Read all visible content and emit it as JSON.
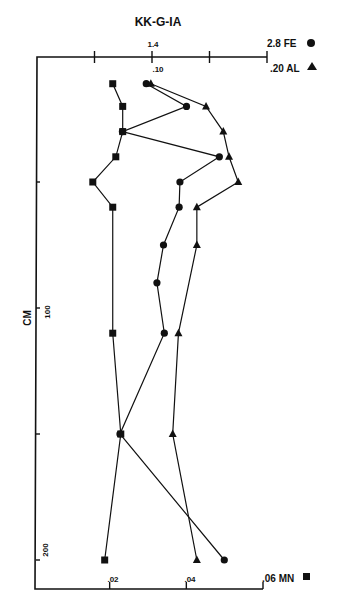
{
  "chart_data": {
    "type": "line",
    "title": "KK-G-IA",
    "orientation": "depth-profile (depth on vertical axis, increasing downward)",
    "ylabel": "CM",
    "ylim": [
      0,
      210
    ],
    "y_ticks": [
      50,
      100,
      150,
      200
    ],
    "y_tick_labels": [
      {
        "value": 100,
        "label": "100"
      },
      {
        "value": 200,
        "label": "200"
      }
    ],
    "top_axis": {
      "scales": [
        {
          "series": "FE",
          "label": "2.8 FE",
          "range": [
            0,
            2.8
          ],
          "labeled_ticks": [
            {
              "value": 1.4,
              "label": "1.4"
            },
            {
              "value": 2.8,
              "label": "2.8"
            }
          ]
        },
        {
          "series": "AL",
          "label": ".20 AL",
          "range": [
            0,
            0.2
          ],
          "labeled_ticks": [
            {
              "value": 0.1,
              "label": ".10"
            },
            {
              "value": 0.2,
              "label": ".20"
            }
          ]
        }
      ],
      "tick_fractions": [
        0.25,
        0.5,
        0.75,
        1.0
      ]
    },
    "bottom_axis": {
      "series": "MN",
      "label": ".06 MN",
      "range": [
        0,
        0.06
      ],
      "labeled_ticks": [
        {
          "value": 0.02,
          "label": ".02"
        },
        {
          "value": 0.04,
          "label": ".04"
        },
        {
          "value": 0.06,
          "label": ".06"
        }
      ]
    },
    "grid": false,
    "legend": [
      {
        "name": "FE",
        "marker": "circle",
        "position": "top-right"
      },
      {
        "name": "AL",
        "marker": "triangle",
        "position": "top-right"
      },
      {
        "name": "MN",
        "marker": "square",
        "position": "bottom-right"
      }
    ],
    "series": [
      {
        "name": "FE",
        "marker": "circle",
        "axis": "top",
        "depth_cm": [
          11,
          20,
          30,
          40,
          50,
          60,
          75,
          90,
          110,
          150,
          200
        ],
        "values": [
          1.33,
          1.82,
          1.04,
          2.22,
          1.74,
          1.73,
          1.54,
          1.46,
          1.55,
          1.01,
          2.28
        ]
      },
      {
        "name": "AL",
        "marker": "triangle",
        "axis": "top",
        "depth_cm": [
          11,
          20,
          30,
          40,
          50,
          60,
          75,
          110,
          150,
          200
        ],
        "values": [
          0.099,
          0.147,
          0.162,
          0.167,
          0.175,
          0.139,
          0.139,
          0.123,
          0.118,
          0.139
        ]
      },
      {
        "name": "MN",
        "marker": "square",
        "axis": "bottom",
        "depth_cm": [
          11,
          20,
          30,
          40,
          50,
          60,
          110,
          150,
          200
        ],
        "values": [
          0.0208,
          0.0234,
          0.0234,
          0.0216,
          0.0156,
          0.0208,
          0.0208,
          0.0229,
          0.0187
        ]
      }
    ]
  },
  "labels": {
    "title": "KK-G-IA",
    "y_axis": "CM",
    "fe_top": "2.8 FE",
    "fe_mid": "1.4",
    "al_top": ".20 AL",
    "al_mid": ".10",
    "mn_ticks": [
      ".02",
      ".04",
      ".06 MN"
    ],
    "depth_ticks": [
      "100",
      "200"
    ]
  },
  "colors": {
    "ink": "#111111",
    "background": "#ffffff"
  }
}
